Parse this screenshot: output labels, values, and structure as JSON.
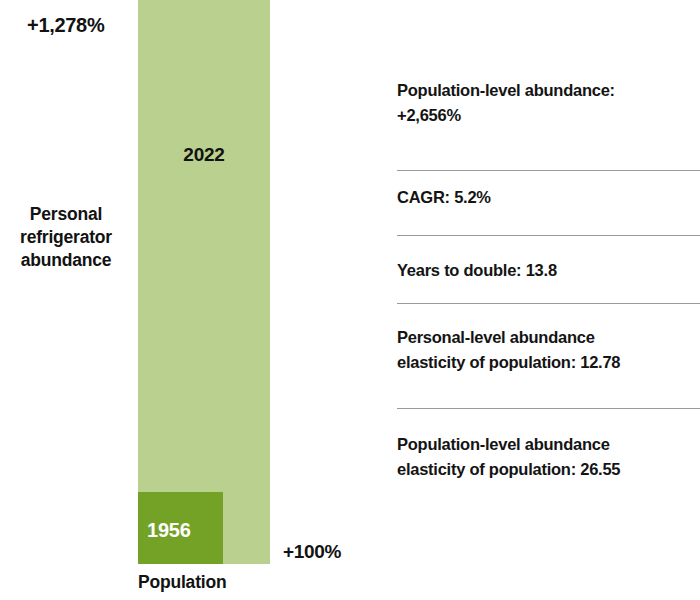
{
  "chart_data": {
    "type": "bar",
    "title": "",
    "subtitle": "",
    "xlabel": "Population",
    "ylabel": "Personal refrigerator abundance",
    "categories": [
      "1956",
      "2022"
    ],
    "series": [
      {
        "name": "Population growth",
        "values": [
          100,
          2656
        ],
        "unit": "%"
      }
    ],
    "annotations": {
      "top_left_pct": "+1,278%",
      "bottom_right_pct": "+100%",
      "inner_square_label": "1956",
      "outer_bar_label": "2022"
    },
    "legend_position": "none",
    "grid": false,
    "colors": {
      "outer_bar": "#b9d08e",
      "inner_bar": "#74a227",
      "text": "#121212",
      "inner_label_text": "#ffffff",
      "divider": "#9a9a9a",
      "background": "#ffffff"
    }
  },
  "chart": {
    "y_axis_label": "Personal\nrefrigerator\nabundance",
    "x_axis_label": "Population",
    "bar_2022_label": "2022",
    "bar_1956_label": "1956",
    "pct_top_left": "+1,278%",
    "pct_bottom_right": "+100%"
  },
  "stats": {
    "rows": [
      {
        "text": "Population-level abundance:\n+2,656%"
      },
      {
        "text": "CAGR: 5.2%"
      },
      {
        "text": "Years to double: 13.8"
      },
      {
        "text": "Personal-level abundance\nelasticity of population: 12.78"
      },
      {
        "text": "Population-level abundance\nelasticity of population: 26.55"
      }
    ]
  }
}
